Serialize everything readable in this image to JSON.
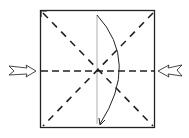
{
  "diagram": {
    "type": "origami-fold-diagram",
    "square": {
      "x": 40,
      "y": 10,
      "width": 115,
      "height": 118,
      "stroke": "#222222"
    },
    "folds": [
      {
        "name": "diagonal-fold-1",
        "style": "dashed",
        "from": [
          40,
          10
        ],
        "to": [
          155,
          128
        ]
      },
      {
        "name": "diagonal-fold-2",
        "style": "dashed",
        "from": [
          155,
          10
        ],
        "to": [
          40,
          128
        ]
      },
      {
        "name": "horizontal-fold",
        "style": "dashed",
        "from": [
          40,
          71
        ],
        "to": [
          155,
          71
        ]
      },
      {
        "name": "vertical-crease",
        "style": "thin-solid",
        "from": [
          97,
          15
        ],
        "to": [
          97,
          124
        ]
      }
    ],
    "arrows": [
      {
        "name": "curved-fold-arrow",
        "kind": "curved",
        "from": [
          97,
          15
        ],
        "to": [
          100,
          125
        ]
      },
      {
        "name": "push-arrow-left",
        "kind": "hollow-push",
        "direction": "right"
      },
      {
        "name": "push-arrow-right",
        "kind": "hollow-push",
        "direction": "left"
      }
    ],
    "colors": {
      "line": "#222222",
      "crease": "#999999",
      "background": "#ffffff"
    }
  }
}
